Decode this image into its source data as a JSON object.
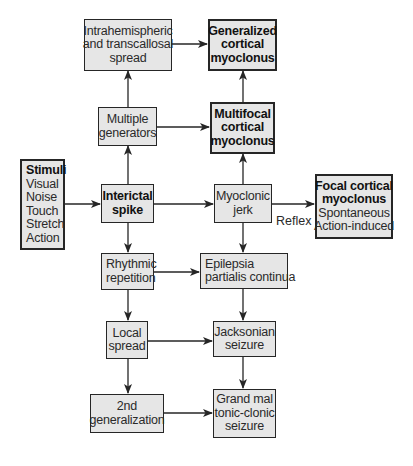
{
  "nodes": {
    "intrahemispheric": {
      "lines": [
        "Intrahemispheric",
        "and transcallosal",
        "spread"
      ]
    },
    "generalized": {
      "lines": [
        "Generalized",
        "cortical",
        "myoclonus"
      ]
    },
    "multiple_generators": {
      "lines": [
        "Multiple",
        "generators"
      ]
    },
    "multifocal": {
      "lines": [
        "Multifocal",
        "cortical",
        "myoclonus"
      ]
    },
    "stimuli": {
      "title": "Stimuli",
      "lines": [
        "Visual",
        "Noise",
        "Touch",
        "Stretch",
        "Action"
      ]
    },
    "interictal_spike": {
      "lines": [
        "Interictal",
        "spike"
      ]
    },
    "myoclonic_jerk": {
      "lines": [
        "Myoclonic",
        "jerk"
      ]
    },
    "focal": {
      "title_lines": [
        "Focal cortical",
        "myoclonus"
      ],
      "lines": [
        "Spontaneous",
        "Action-induced"
      ]
    },
    "rhythmic": {
      "lines": [
        "Rhythmic",
        "repetition"
      ]
    },
    "epilepsia": {
      "lines": [
        "Epilepsia",
        "partialis continua"
      ]
    },
    "local_spread": {
      "lines": [
        "Local",
        "spread"
      ]
    },
    "jacksonian": {
      "lines": [
        "Jacksonian",
        "seizure"
      ]
    },
    "second_generalization": {
      "lines": [
        "2nd",
        "generalization"
      ]
    },
    "grand_mal": {
      "lines": [
        "Grand mal",
        "tonic-clonic",
        "seizure"
      ]
    }
  },
  "edge_labels": {
    "reflex": "Reflex"
  },
  "colors": {
    "box_fill": "#e6e6e6",
    "box_border": "#262626",
    "arrow": "#262626"
  }
}
